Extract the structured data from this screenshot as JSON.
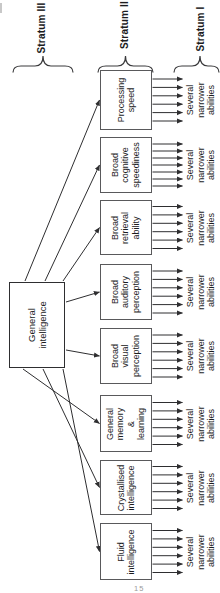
{
  "strata": [
    {
      "label": "Stratum III"
    },
    {
      "label": "Stratum II"
    },
    {
      "label": "Stratum I"
    }
  ],
  "general_factor": {
    "label": "General\nintelligence"
  },
  "broad_abilities": [
    {
      "label": "Processing\nspeed",
      "narrow": {
        "label": "Several\nnarrower\nabilities",
        "arrow_count": 6
      }
    },
    {
      "label": "Broad\ncognitive\nspeediness",
      "narrow": {
        "label": "Several\nnarrower\nabilities",
        "arrow_count": 7
      }
    },
    {
      "label": "Broad\nretrieval\nability",
      "narrow": {
        "label": "Several\nnarrower\nabilities",
        "arrow_count": 6
      }
    },
    {
      "label": "Broad\nauditory\nperception",
      "narrow": {
        "label": "Several\nnarrower\nabilities",
        "arrow_count": 6
      }
    },
    {
      "label": "Broad\nvisual\nperception",
      "narrow": {
        "label": "Several\nnarrower\nabilities",
        "arrow_count": 6
      }
    },
    {
      "label": "General\nmemory &\nlearning",
      "narrow": {
        "label": "Several\nnarrower\nabilities",
        "arrow_count": 6
      }
    },
    {
      "label": "Crystallised\nintelligence",
      "narrow": {
        "label": "Several\nnarrower\nabilities",
        "arrow_count": 6
      }
    },
    {
      "label": "Fluid\nintelligence",
      "narrow": {
        "label": "Several\nnarrower\nabilities",
        "arrow_count": 6
      }
    }
  ],
  "page_number": "15",
  "colors": {
    "background": "#ffffff",
    "box_border": "#59595b",
    "general_border": "#2e2e30",
    "arrow": "#2e2e30",
    "brace": "#3a3a3c",
    "text": "#1c1c1e"
  }
}
